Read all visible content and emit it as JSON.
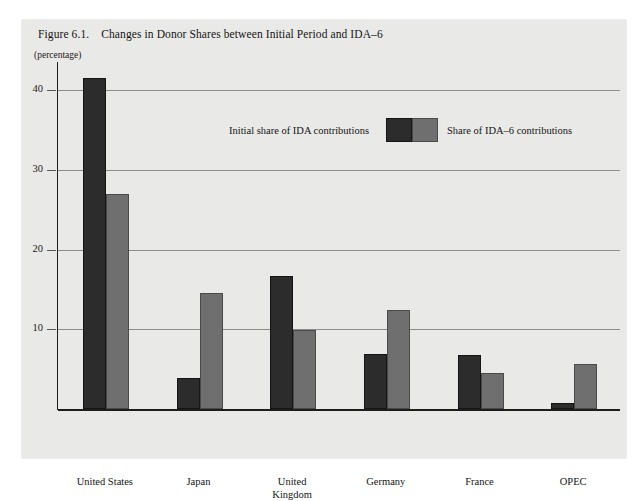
{
  "figure": {
    "number": "Figure 6.1.",
    "title": "Changes in Donor Shares between Initial Period and IDA–6",
    "unit_label": "(percentage)"
  },
  "legend": {
    "left_label": "Initial share of IDA contributions",
    "right_label": "Share of IDA–6 contributions",
    "dark_swatch_name": "initial-share-swatch",
    "light_swatch_name": "ida6-share-swatch"
  },
  "colors": {
    "panel_background": "#e9e9e7",
    "page_background": "#ffffff",
    "series_initial": "#2c2c2c",
    "series_ida6": "#6f6f6f",
    "gridline": "#8d8d8a",
    "axis": "#1d1d1d",
    "text": "#141414"
  },
  "chart_data": {
    "type": "bar",
    "title": "Changes in Donor Shares between Initial Period and IDA–6",
    "xlabel": "",
    "ylabel": "(percentage)",
    "ylim": [
      0,
      44
    ],
    "yticks": [
      10,
      20,
      30,
      40
    ],
    "ytick_labels": [
      "10",
      "20",
      "30",
      "40"
    ],
    "grid": true,
    "legend_position": "top-center",
    "categories": [
      "United States",
      "Japan",
      "United\nKingdom",
      "Germany",
      "France",
      "OPEC"
    ],
    "category_lines": [
      [
        "United States"
      ],
      [
        "Japan"
      ],
      [
        "United",
        "Kingdom"
      ],
      [
        "Germany"
      ],
      [
        "France"
      ],
      [
        "OPEC"
      ]
    ],
    "series": [
      {
        "name": "Initial share of IDA contributions",
        "color": "#2c2c2c",
        "values": [
          41.5,
          3.9,
          16.7,
          6.9,
          6.8,
          0.8
        ]
      },
      {
        "name": "Share of IDA–6 contributions",
        "color": "#6f6f6f",
        "values": [
          27.0,
          14.6,
          9.9,
          12.4,
          4.5,
          5.6
        ]
      }
    ]
  }
}
